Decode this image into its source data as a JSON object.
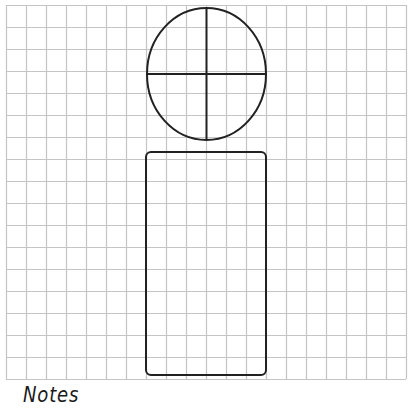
{
  "page": {
    "notes_label": "Notes"
  },
  "grid": {
    "x": 6,
    "y": 5,
    "cols": 20,
    "rows": 17,
    "cell_width": 20,
    "cell_height": 22,
    "line_color": "#c4c4c4"
  },
  "shapes": {
    "stroke_color": "#222222",
    "head": {
      "type": "ellipse",
      "cx": 206.5,
      "cy": 74,
      "rx": 59.5,
      "ry": 66,
      "crosshair": true
    },
    "body": {
      "type": "rounded-rect",
      "x": 146,
      "y": 152,
      "width": 120,
      "height": 223,
      "rx": 5
    }
  }
}
